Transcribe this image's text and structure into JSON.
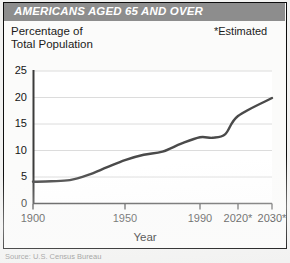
{
  "title": "AMERICANS AGED 65 AND OVER",
  "subtitle_left": "Percentage of\nTotal Population",
  "subtitle_left_line1": "Percentage of",
  "subtitle_left_line2": "Total Population",
  "footnote": "*Estimated",
  "source": "Source: U.S. Census Bureau",
  "colors": {
    "title_bar": "#8d8d8d",
    "title_text": "#ffffff",
    "line": "#4a4a4a",
    "gridline": "#dcdcdc",
    "axis": "#3b3b3b",
    "plot_background": "#ffffff",
    "frame": "#0e0e0e",
    "page_background": "#f2f2f1"
  },
  "chart_data": {
    "type": "line",
    "title": "AMERICANS AGED 65 AND OVER",
    "subtitle": "Percentage of Total Population",
    "xlabel": "Year",
    "ylabel": "Percentage of Total Population",
    "ylim": [
      0,
      25
    ],
    "yticks": [
      0,
      5,
      10,
      15,
      20,
      25
    ],
    "ytick_labels": [
      "0",
      "5",
      "10",
      "15",
      "20",
      "25"
    ],
    "xtick_labels": [
      "1900",
      "1950",
      "1990",
      "2020*",
      "2030*"
    ],
    "xticks": [
      1900,
      1950,
      1990,
      2020,
      2030
    ],
    "grid": true,
    "legend": false,
    "annotations": [
      "*Estimated"
    ],
    "series": [
      {
        "name": "Percentage aged 65 and over",
        "x": [
          1900,
          1910,
          1920,
          1930,
          1940,
          1950,
          1960,
          1970,
          1980,
          1990,
          2000,
          2010,
          2020,
          2030
        ],
        "values": [
          4.1,
          4.2,
          4.4,
          5.4,
          6.8,
          8.2,
          9.2,
          9.8,
          11.3,
          12.5,
          12.4,
          13.1,
          16.5,
          19.9
        ]
      }
    ]
  }
}
